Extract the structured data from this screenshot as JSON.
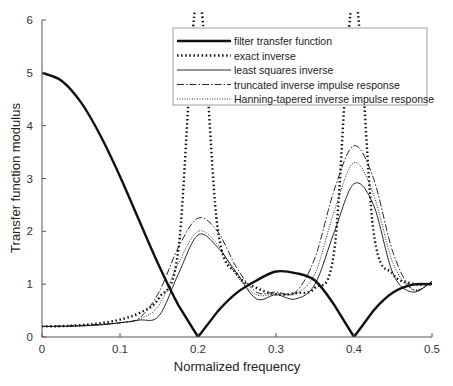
{
  "chart_data": {
    "type": "line",
    "title": "",
    "xlabel": "Normalized frequency",
    "ylabel": "Transfer function modulus",
    "xlim": [
      0,
      0.5
    ],
    "ylim": [
      0,
      6
    ],
    "xticks": [
      "0",
      "0.1",
      "0.2",
      "0.3",
      "0.4",
      "0.5"
    ],
    "yticks": [
      "0",
      "1",
      "2",
      "3",
      "4",
      "5",
      "6"
    ],
    "grid": false,
    "legend_position": "upper right",
    "x": [
      0,
      0.025,
      0.05,
      0.075,
      0.1,
      0.125,
      0.15,
      0.175,
      0.2,
      0.225,
      0.25,
      0.275,
      0.3,
      0.325,
      0.35,
      0.375,
      0.4,
      0.425,
      0.45,
      0.475,
      0.5
    ],
    "series": [
      {
        "name": "filter transfer function",
        "style": "solid-thick",
        "values": [
          5.0,
          4.85,
          4.44,
          3.81,
          3.04,
          2.19,
          1.35,
          0.6,
          0.0,
          0.48,
          0.84,
          1.07,
          1.24,
          1.21,
          1.07,
          0.6,
          0.0,
          0.5,
          0.84,
          0.99,
          1.0
        ]
      },
      {
        "name": "exact inverse",
        "style": "dotted-thick",
        "values": [
          0.2,
          0.206,
          0.225,
          0.262,
          0.329,
          0.457,
          0.74,
          1.67,
          6.5,
          2.08,
          1.19,
          0.93,
          0.81,
          0.83,
          0.93,
          1.67,
          6.5,
          2.0,
          1.19,
          1.01,
          1.0
        ]
      },
      {
        "name": "least squares inverse",
        "style": "solid-thin",
        "values": [
          0.2,
          0.2,
          0.21,
          0.23,
          0.27,
          0.32,
          0.4,
          1.2,
          1.93,
          1.7,
          1.2,
          0.72,
          0.8,
          0.72,
          1.0,
          2.0,
          2.9,
          2.5,
          1.2,
          0.85,
          1.05
        ]
      },
      {
        "name": "truncated inverse impulse response",
        "style": "dashdot",
        "values": [
          0.2,
          0.21,
          0.22,
          0.24,
          0.27,
          0.36,
          0.85,
          1.7,
          2.25,
          2.0,
          1.3,
          0.85,
          0.85,
          0.85,
          1.5,
          2.8,
          3.62,
          3.0,
          1.6,
          0.9,
          1.05
        ]
      },
      {
        "name": "Hanning-tapered inverse impulse response",
        "style": "dotted-thin",
        "values": [
          0.2,
          0.2,
          0.21,
          0.23,
          0.27,
          0.34,
          0.6,
          1.4,
          2.0,
          1.75,
          1.15,
          0.8,
          0.82,
          0.82,
          1.2,
          2.4,
          3.3,
          2.7,
          1.4,
          0.9,
          1.05
        ]
      }
    ]
  }
}
